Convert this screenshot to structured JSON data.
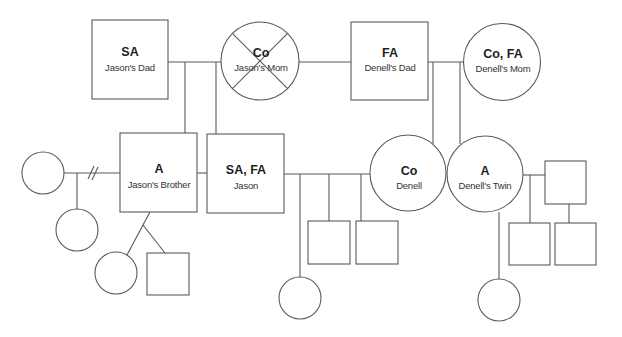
{
  "diagram": {
    "type": "genogram",
    "persons": {
      "jasons_dad": {
        "code": "SA",
        "label": "Jason's Dad",
        "sex": "male"
      },
      "jasons_mom": {
        "code": "Co",
        "label": "Jason's Mom",
        "sex": "female",
        "deceased": true
      },
      "denells_dad": {
        "code": "FA",
        "label": "Denell's Dad",
        "sex": "male"
      },
      "denells_mom": {
        "code": "Co, FA",
        "label": "Denell's Mom",
        "sex": "female"
      },
      "jasons_brother": {
        "code": "A",
        "label": "Jason's Brother",
        "sex": "male"
      },
      "jason": {
        "code": "SA, FA",
        "label": "Jason",
        "sex": "male"
      },
      "denell": {
        "code": "Co",
        "label": "Denell",
        "sex": "female"
      },
      "denells_twin": {
        "code": "A",
        "label": "Denell's Twin",
        "sex": "female"
      },
      "brothers_ex_partner": {
        "code": "",
        "label": "",
        "sex": "female"
      },
      "brothers_child_with_ex": {
        "code": "",
        "label": "",
        "sex": "female"
      },
      "brothers_twin_daughter": {
        "code": "",
        "label": "",
        "sex": "female"
      },
      "brothers_twin_son": {
        "code": "",
        "label": "",
        "sex": "male"
      },
      "jason_denell_daughter": {
        "code": "",
        "label": "",
        "sex": "female"
      },
      "jason_denell_son_1": {
        "code": "",
        "label": "",
        "sex": "male"
      },
      "jason_denell_son_2": {
        "code": "",
        "label": "",
        "sex": "male"
      },
      "twins_daughter": {
        "code": "",
        "label": "",
        "sex": "female"
      },
      "twins_partner": {
        "code": "",
        "label": "",
        "sex": "male"
      },
      "twins_son_1": {
        "code": "",
        "label": "",
        "sex": "male"
      },
      "twins_son_2": {
        "code": "",
        "label": "",
        "sex": "male"
      }
    },
    "relationships": [
      {
        "type": "marriage",
        "between": [
          "jasons_dad",
          "jasons_mom"
        ]
      },
      {
        "type": "marriage",
        "between": [
          "jasons_mom",
          "denells_dad"
        ]
      },
      {
        "type": "marriage",
        "between": [
          "denells_dad",
          "denells_mom"
        ]
      },
      {
        "type": "divorce",
        "between": [
          "brothers_ex_partner",
          "jasons_brother"
        ]
      },
      {
        "type": "marriage",
        "between": [
          "jason",
          "denell"
        ]
      },
      {
        "type": "partnership",
        "between": [
          "denells_twin",
          "twins_partner"
        ]
      },
      {
        "type": "twins",
        "between": [
          "denell",
          "denells_twin"
        ]
      },
      {
        "type": "twins",
        "between": [
          "brothers_twin_daughter",
          "brothers_twin_son"
        ]
      }
    ],
    "colors": {
      "stroke": "#5a5a5a",
      "text": "#1e1e1e",
      "background": "#ffffff"
    }
  }
}
